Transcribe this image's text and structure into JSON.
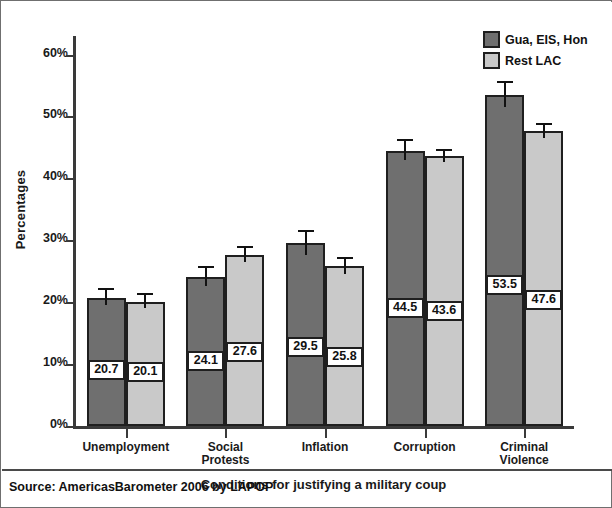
{
  "chart_data": {
    "type": "bar",
    "title": "",
    "categories": [
      "Unemployment",
      "Social\nProtests",
      "Inflation",
      "Corruption",
      "Criminal\nViolence"
    ],
    "series": [
      {
        "name": "Gua, EIS, Hon",
        "color": "#6f6f6f",
        "values": [
          20.7,
          24.1,
          29.5,
          44.5,
          53.5
        ],
        "err_low": [
          1.2,
          1.5,
          1.9,
          1.6,
          1.9
        ],
        "err_high": [
          1.2,
          1.5,
          1.9,
          1.6,
          1.9
        ]
      },
      {
        "name": "Rest LAC",
        "color": "#c9c9c9",
        "values": [
          20.1,
          27.6,
          25.8,
          43.6,
          47.6
        ],
        "err_low": [
          1.0,
          1.1,
          1.2,
          0.9,
          1.0
        ],
        "err_high": [
          1.0,
          1.1,
          1.2,
          0.9,
          1.0
        ]
      }
    ],
    "value_labels": [
      [
        "20.7",
        "20.1"
      ],
      [
        "24.1",
        "27.6"
      ],
      [
        "29.5",
        "25.8"
      ],
      [
        "44.5",
        "43.6"
      ],
      [
        "53.5",
        "47.6"
      ]
    ],
    "xlabel": "Conditions for justifying a military coup",
    "ylabel": "Percentages",
    "ylim": [
      0,
      63
    ],
    "yticks": [
      0,
      10,
      20,
      30,
      40,
      50,
      60
    ],
    "ytick_labels": [
      "0%",
      "10%",
      "20%",
      "30%",
      "40%",
      "50%",
      "60%"
    ],
    "grid": false,
    "legend_position": "top-right",
    "error_bars": true
  },
  "legend": {
    "items": [
      {
        "label": "Gua, EIS, Hon",
        "swatch": "dark-gray-swatch"
      },
      {
        "label": "Rest LAC",
        "swatch": "light-gray-swatch"
      }
    ]
  },
  "footer": {
    "source": "Source: AmericasBarometer 2006 by LAPOP"
  },
  "colors": {
    "series_dark": "#6f6f6f",
    "series_light": "#c9c9c9",
    "outline": "#1f1f1f",
    "axis": "#3a3a3a",
    "text": "#111111",
    "background": "#ffffff"
  }
}
